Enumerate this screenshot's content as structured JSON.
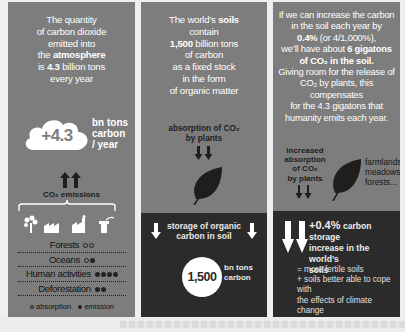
{
  "colors": {
    "panel_bg": "#7d7d7d",
    "panel_dark": "#2b2b2b",
    "page_bg": "#efefef",
    "text_light": "#ffffff",
    "text_dark": "#1e1e1e"
  },
  "panel1": {
    "intro": {
      "l1": "The quantity",
      "l2": "of carbon dioxide",
      "l3": "emitted into",
      "l4_pre": "the ",
      "l4_bold": "atmosphere",
      "l5_pre": "is ",
      "l5_bold": "4.3",
      "l5_post": " billion tons",
      "l6": "every year"
    },
    "cloud_value": "+4.3",
    "cloud_unit": {
      "l1": "bn tons",
      "l2": "carbon",
      "l3": "/ year"
    },
    "emissions_label": "CO₂ emissions",
    "icons": [
      "tree-icon",
      "factory-icon",
      "industry-icon",
      "chimney-icon"
    ],
    "sources": [
      {
        "label": "Forests",
        "dots": [
          "absorption",
          "absorption"
        ]
      },
      {
        "label": "Oceans",
        "dots": [
          "absorption",
          "emission"
        ]
      },
      {
        "label": "Human activities",
        "dots": [
          "emission",
          "emission",
          "emission",
          "emission"
        ]
      },
      {
        "label": "Deforestation",
        "dots": [
          "emission",
          "emission"
        ]
      }
    ],
    "legend": {
      "absorption": "absorption",
      "emission": "emission"
    }
  },
  "panel2": {
    "intro": {
      "l1_pre": "The world’s ",
      "l1_bold": "soils",
      "l2": "contain",
      "l3_bold": "1,500",
      "l3_post": " billion tons",
      "l4": "of carbon",
      "l5": "as a fixed stock",
      "l6": "in the form",
      "l7": "of organic matter"
    },
    "absorption_label": {
      "l1": "absorption of CO₂",
      "l2": "by plants"
    },
    "storage_label": {
      "l1": "storage of organic",
      "l2": "carbon in soil"
    },
    "circle_value": "1,500",
    "circle_unit": {
      "l1": "bn tons",
      "l2": "carbon"
    }
  },
  "panel3": {
    "intro": {
      "l1": "If we can increase the carbon",
      "l2": "in the soil each year by",
      "l3_bold": "0.4%",
      "l3_post": " (or 4/1,000%),",
      "l4_pre": "we’ll have about ",
      "l4_bold": "6 gigatons",
      "l5_bold": "of CO₂ in the soil.",
      "l6": "Giving room for the release of",
      "l7": "CO₂ by plants, this compensates",
      "l8": "for the 4.3 gigatons that",
      "l9": "humanity emits each year."
    },
    "increase_label": {
      "l1": "increased",
      "l2": "absorption",
      "l3": "of CO₂",
      "l4": "by plants"
    },
    "farm_label": {
      "l1": "farmlands,",
      "l2": "meadows,",
      "l3": "forests..."
    },
    "storage": {
      "pct": "+0.4%",
      "l1_post": " carbon storage",
      "l2": "increase in the world’s",
      "l3": "soils"
    },
    "benefits": {
      "l1": "= more fertile soils",
      "l2": "+ soils better able to cope with",
      "l3": "the effects of climate change"
    }
  }
}
